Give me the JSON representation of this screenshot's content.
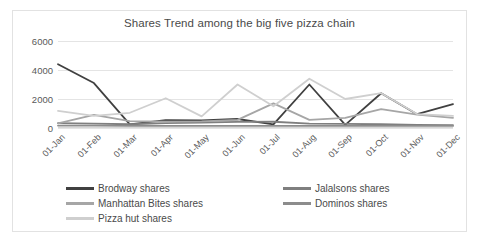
{
  "chart_data": {
    "type": "line",
    "title": "Shares Trend among the big five pizza chain",
    "xlabel": "",
    "ylabel": "",
    "ylim": [
      0,
      6000
    ],
    "yticks": [
      0,
      2000,
      4000,
      6000
    ],
    "grid": true,
    "legend_position": "bottom",
    "categories": [
      "01-Jan",
      "01-Feb",
      "01-Mar",
      "01-Apr",
      "01-May",
      "01-Jun",
      "01-Jul",
      "01-Aug",
      "01-Sep",
      "01-Oct",
      "01-Nov",
      "01-Dec"
    ],
    "series": [
      {
        "name": "Brodway shares",
        "color": "#404040",
        "values": [
          4400,
          3100,
          250,
          550,
          520,
          620,
          250,
          3000,
          220,
          2400,
          950,
          1650
        ]
      },
      {
        "name": "Jalalsons shares",
        "color": "#7f7f7f",
        "values": [
          330,
          300,
          260,
          330,
          380,
          420,
          430,
          300,
          280,
          260,
          220,
          200
        ]
      },
      {
        "name": "Manhattan Bites shares",
        "color": "#a6a6a6",
        "values": [
          320,
          900,
          480,
          430,
          460,
          560,
          1700,
          560,
          700,
          1300,
          930,
          700
        ]
      },
      {
        "name": "Dominos shares",
        "color": "#8c8c8c",
        "values": [
          170,
          160,
          150,
          150,
          150,
          150,
          150,
          150,
          150,
          150,
          140,
          140
        ]
      },
      {
        "name": "Pizza hut shares",
        "color": "#cfcfcf",
        "values": [
          1180,
          830,
          1050,
          2050,
          800,
          3000,
          1500,
          3400,
          2000,
          2400,
          960,
          830
        ]
      }
    ]
  },
  "legend": {
    "columns": [
      {
        "items": [
          {
            "label": "Brodway shares",
            "color": "#404040"
          },
          {
            "label": "Manhattan Bites shares",
            "color": "#a6a6a6"
          },
          {
            "label": "Pizza hut shares",
            "color": "#cfcfcf"
          }
        ]
      },
      {
        "items": [
          {
            "label": "Jalalsons shares",
            "color": "#7f7f7f"
          },
          {
            "label": "Dominos shares",
            "color": "#8c8c8c"
          }
        ]
      }
    ]
  }
}
